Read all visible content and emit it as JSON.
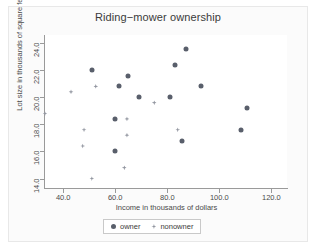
{
  "chart_data": {
    "type": "scatter",
    "title": "Riding−mower ownership",
    "xlabel": "Income in thousands of dollars",
    "ylabel": "Lot size in thousands of square feet",
    "xlim": [
      33.0,
      126.0
    ],
    "ylim": [
      13.3,
      24.6
    ],
    "xticks": [
      40.0,
      60.0,
      80.0,
      100.0,
      120.0
    ],
    "yticks": [
      14.0,
      16.0,
      18.0,
      20.0,
      22.0,
      24.0
    ],
    "xtick_labels": [
      "40.0",
      "60.0",
      "80.0",
      "100.0",
      "120.0"
    ],
    "ytick_labels": [
      "14.0",
      "16.0",
      "18.0",
      "20.0",
      "22.0",
      "24.0"
    ],
    "grid": false,
    "legend_position": "bottom",
    "colors": {
      "owner": "#595f6b",
      "nonowner": "#9296a0",
      "axis": "#9a9a9a",
      "text": "#4a4a4a",
      "background": "#ffffff"
    },
    "series": [
      {
        "name": "owner",
        "marker": "circle",
        "points": [
          {
            "x": 51.0,
            "y": 22.0
          },
          {
            "x": 61.5,
            "y": 20.8
          },
          {
            "x": 64.8,
            "y": 21.6
          },
          {
            "x": 69.0,
            "y": 20.0
          },
          {
            "x": 81.0,
            "y": 20.0
          },
          {
            "x": 83.0,
            "y": 22.4
          },
          {
            "x": 87.0,
            "y": 23.6
          },
          {
            "x": 93.0,
            "y": 20.8
          },
          {
            "x": 85.5,
            "y": 16.8
          },
          {
            "x": 108.5,
            "y": 17.6
          },
          {
            "x": 110.5,
            "y": 19.2
          },
          {
            "x": 59.8,
            "y": 18.4
          },
          {
            "x": 60.0,
            "y": 16.0
          }
        ]
      },
      {
        "name": "nonowner",
        "marker": "plus-diamond",
        "points": [
          {
            "x": 33.0,
            "y": 18.8
          },
          {
            "x": 43.0,
            "y": 20.4
          },
          {
            "x": 48.0,
            "y": 17.6
          },
          {
            "x": 47.5,
            "y": 16.4
          },
          {
            "x": 52.5,
            "y": 20.8
          },
          {
            "x": 51.0,
            "y": 14.0
          },
          {
            "x": 64.5,
            "y": 18.4
          },
          {
            "x": 64.5,
            "y": 17.2
          },
          {
            "x": 63.5,
            "y": 14.8
          },
          {
            "x": 75.0,
            "y": 19.6
          },
          {
            "x": 84.0,
            "y": 17.6
          }
        ]
      }
    ]
  },
  "legend": {
    "items": [
      {
        "label": "owner",
        "marker": "circle"
      },
      {
        "label": "nonowner",
        "marker": "plus-diamond"
      }
    ]
  }
}
